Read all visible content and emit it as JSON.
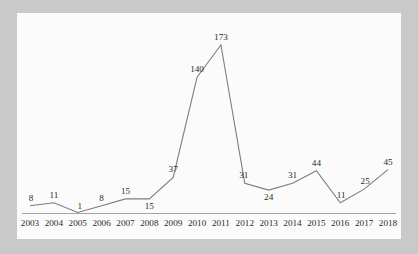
{
  "chart_data": {
    "type": "line",
    "title": "",
    "subtitle": "",
    "xlabel": "",
    "ylabel": "",
    "categories": [
      "2003",
      "2004",
      "2005",
      "2006",
      "2007",
      "2008",
      "2009",
      "2010",
      "2011",
      "2012",
      "2013",
      "2014",
      "2015",
      "2016",
      "2017",
      "2018"
    ],
    "values": [
      8,
      11,
      1,
      8,
      15,
      15,
      37,
      140,
      173,
      31,
      24,
      31,
      44,
      11,
      25,
      45
    ],
    "series": [
      {
        "name": "",
        "values": [
          8,
          11,
          1,
          8,
          15,
          15,
          37,
          140,
          173,
          31,
          24,
          31,
          44,
          11,
          25,
          45
        ]
      }
    ],
    "point_labels": [
      "8",
      "11",
      "1",
      "8",
      "15",
      "15",
      "37",
      "140",
      "173",
      "31",
      "24",
      "31",
      "44",
      "11",
      "25",
      "45"
    ],
    "xlim": [
      2003,
      2018
    ],
    "ylim": [
      0,
      173
    ],
    "grid": false,
    "legend": false,
    "legend_position": "none",
    "data_labels_shown": true,
    "markers_shown": false,
    "x_axis_visible": true,
    "y_axis_visible": false
  },
  "style": {
    "line_color": "#7d7d7d",
    "axis_color": "#9a9a9a",
    "label_color": "#2b2b2b",
    "panel_background": "#fbfbfb",
    "page_background": "#c9c9c9"
  }
}
